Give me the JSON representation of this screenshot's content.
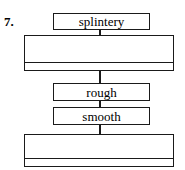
{
  "diagram": {
    "item_number": "7.",
    "type": "flow-chart-vertical",
    "line_color": "#1a1a1a",
    "background_color": "#ffffff",
    "nodes": [
      {
        "id": "node-1",
        "kind": "label-box",
        "label": "splintery"
      },
      {
        "id": "node-2",
        "kind": "blank-box-with-rule",
        "label": ""
      },
      {
        "id": "node-3",
        "kind": "label-box",
        "label": "rough"
      },
      {
        "id": "node-4",
        "kind": "label-box",
        "label": "smooth"
      },
      {
        "id": "node-5",
        "kind": "blank-box-with-rule",
        "label": ""
      }
    ],
    "connectors": [
      {
        "from": "node-1",
        "to": "node-2"
      },
      {
        "from": "node-2",
        "to": "node-3"
      },
      {
        "from": "node-3",
        "to": "node-4"
      },
      {
        "from": "node-4",
        "to": "node-5"
      }
    ]
  }
}
